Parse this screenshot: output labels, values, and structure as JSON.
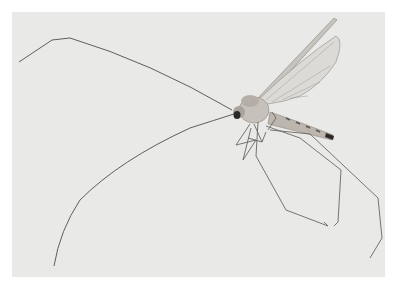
{
  "image": {
    "subject": "crane fly (long-legged insect) with long antennae",
    "caption": "Insect photograph on light gray background",
    "colors": {
      "border": "#ffffff",
      "background": "#e9e9e7",
      "line": "#5a5a58",
      "wing": "#d6d4d0",
      "body": "#b8b3ac",
      "dark": "#2c2a28"
    }
  }
}
